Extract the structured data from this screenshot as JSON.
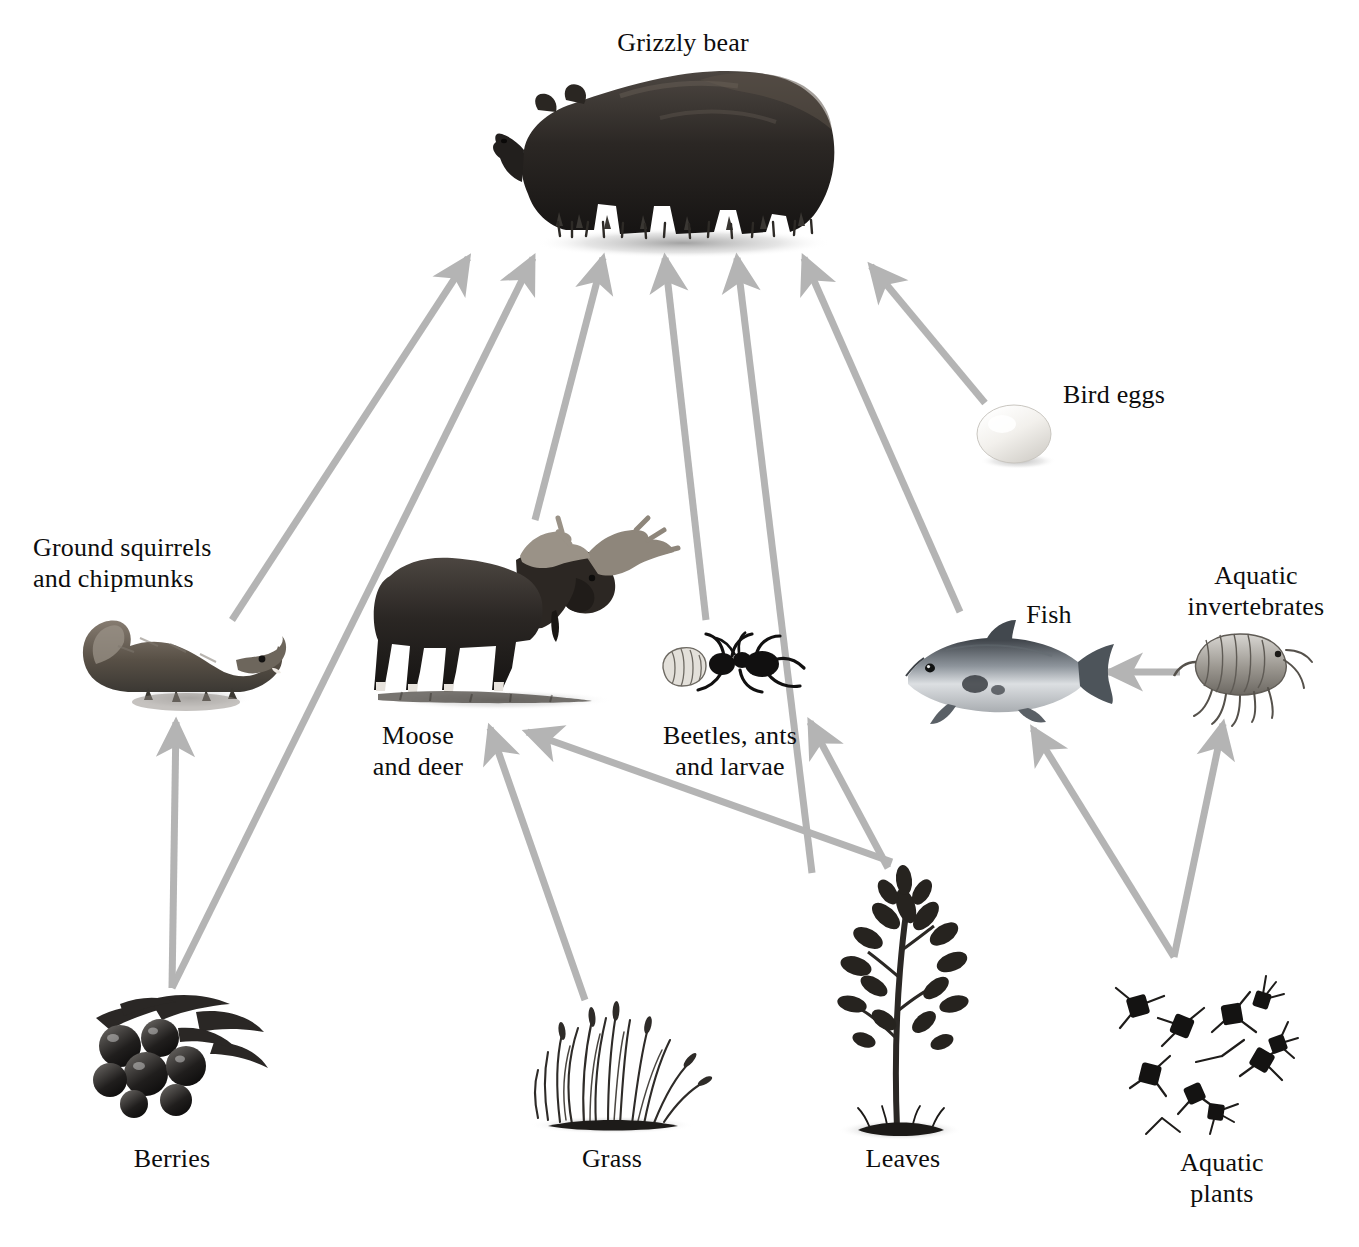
{
  "figure": {
    "kind": "food-web-diagram",
    "cropped_title_fragment": "",
    "arrow_color": "#b4b4b4",
    "background_color": "#ffffff",
    "text_color": "#0d0d0d"
  },
  "nodes": [
    {
      "id": "grizzly_bear",
      "label": "Grizzly bear",
      "icon": "grizzly-bear-illustration",
      "x": 683,
      "y": 150,
      "label_x": 683,
      "label_y": 28,
      "align": "center",
      "trophic": "apex predator / omnivore"
    },
    {
      "id": "bird_eggs",
      "label": "Bird eggs",
      "icon": "bird-egg-illustration",
      "x": 1015,
      "y": 434,
      "label_x": 1114,
      "label_y": 380,
      "align": "center",
      "trophic": "food source"
    },
    {
      "id": "ground_squirrels",
      "label": "Ground squirrels\nand chipmunks",
      "icon": "ground-squirrel-illustration",
      "x": 180,
      "y": 658,
      "label_x": 33,
      "label_y": 533,
      "align": "left",
      "trophic": "primary consumer"
    },
    {
      "id": "moose_and_deer",
      "label": "Moose\nand deer",
      "icon": "moose-illustration",
      "x": 500,
      "y": 630,
      "label_x": 418,
      "label_y": 721,
      "align": "center",
      "trophic": "primary consumer"
    },
    {
      "id": "beetles_ants_larvae",
      "label": "Beetles, ants\nand larvae",
      "icon": "beetle-ant-larva-illustration",
      "x": 740,
      "y": 675,
      "label_x": 730,
      "label_y": 721,
      "align": "center",
      "trophic": "primary consumer"
    },
    {
      "id": "fish",
      "label": "Fish",
      "icon": "salmon-illustration",
      "x": 1000,
      "y": 672,
      "label_x": 1049,
      "label_y": 600,
      "align": "center",
      "trophic": "secondary consumer"
    },
    {
      "id": "aquatic_inverts",
      "label": "Aquatic\ninvertebrates",
      "icon": "amphipod-illustration",
      "x": 1235,
      "y": 672,
      "label_x": 1256,
      "label_y": 561,
      "align": "center",
      "trophic": "primary consumer"
    },
    {
      "id": "berries",
      "label": "Berries",
      "icon": "berries-illustration",
      "x": 172,
      "y": 1055,
      "label_x": 172,
      "label_y": 1144,
      "align": "center",
      "trophic": "producer"
    },
    {
      "id": "grass",
      "label": "Grass",
      "icon": "grass-illustration",
      "x": 612,
      "y": 1075,
      "label_x": 612,
      "label_y": 1144,
      "align": "center",
      "trophic": "producer"
    },
    {
      "id": "leaves",
      "label": "Leaves",
      "icon": "leafy-tree-illustration",
      "x": 903,
      "y": 1010,
      "label_x": 903,
      "label_y": 1144,
      "align": "center",
      "trophic": "producer"
    },
    {
      "id": "aquatic_plants",
      "label": "Aquatic\nplants",
      "icon": "aquatic-plant-diatoms-illustration",
      "x": 1205,
      "y": 1055,
      "label_x": 1222,
      "label_y": 1148,
      "align": "center",
      "trophic": "producer"
    }
  ],
  "edges": [
    {
      "id": "e1",
      "from": "ground_squirrels",
      "to": "grizzly_bear",
      "meaning": "eaten by",
      "x1": 232,
      "y1": 620,
      "x2": 468,
      "y2": 258
    },
    {
      "id": "e2",
      "from": "berries",
      "to": "grizzly_bear",
      "meaning": "eaten by",
      "x1": 172,
      "y1": 988,
      "x2": 533,
      "y2": 258
    },
    {
      "id": "e3",
      "from": "moose_and_deer",
      "to": "grizzly_bear",
      "meaning": "eaten by",
      "x1": 535,
      "y1": 520,
      "x2": 603,
      "y2": 258
    },
    {
      "id": "e4",
      "from": "beetles_ants_larvae",
      "to": "grizzly_bear",
      "meaning": "eaten by",
      "x1": 706,
      "y1": 620,
      "x2": 665,
      "y2": 258
    },
    {
      "id": "e5",
      "from": "leaves",
      "to": "grizzly_bear",
      "meaning": "eaten by",
      "x1": 812,
      "y1": 873,
      "x2": 737,
      "y2": 258
    },
    {
      "id": "e6",
      "from": "fish",
      "to": "grizzly_bear",
      "meaning": "eaten by",
      "x1": 960,
      "y1": 612,
      "x2": 804,
      "y2": 258
    },
    {
      "id": "e7",
      "from": "bird_eggs",
      "to": "grizzly_bear",
      "meaning": "eaten by",
      "x1": 985,
      "y1": 403,
      "x2": 871,
      "y2": 266
    },
    {
      "id": "e8",
      "from": "berries",
      "to": "ground_squirrels",
      "meaning": "eaten by",
      "x1": 172,
      "y1": 988,
      "x2": 176,
      "y2": 722
    },
    {
      "id": "e9",
      "from": "grass",
      "to": "moose_and_deer",
      "meaning": "eaten by",
      "x1": 585,
      "y1": 1000,
      "x2": 490,
      "y2": 728
    },
    {
      "id": "e10",
      "from": "leaves",
      "to": "moose_and_deer",
      "meaning": "eaten by",
      "x1": 892,
      "y1": 862,
      "x2": 527,
      "y2": 732
    },
    {
      "id": "e11",
      "from": "leaves",
      "to": "beetles_ants_larvae",
      "meaning": "eaten by",
      "x1": 888,
      "y1": 868,
      "x2": 810,
      "y2": 722
    },
    {
      "id": "e12",
      "from": "aquatic_plants",
      "to": "fish",
      "meaning": "eaten by",
      "x1": 1174,
      "y1": 957,
      "x2": 1033,
      "y2": 729
    },
    {
      "id": "e13",
      "from": "aquatic_plants",
      "to": "aquatic_inverts",
      "meaning": "eaten by",
      "x1": 1174,
      "y1": 957,
      "x2": 1223,
      "y2": 724
    },
    {
      "id": "e14",
      "from": "aquatic_inverts",
      "to": "fish",
      "meaning": "eaten by",
      "x1": 1180,
      "y1": 672,
      "x2": 1108,
      "y2": 672
    }
  ]
}
